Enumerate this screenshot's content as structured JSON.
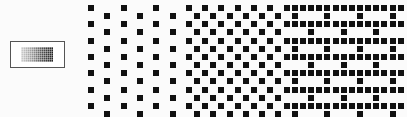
{
  "thumbnail": {
    "label": "halftone-preview"
  },
  "pattern": {
    "origin_x": 88,
    "origin_y": 5,
    "cell": 8.15,
    "dot_size": 6,
    "dot_color": "#111111",
    "sections": [
      {
        "name": "sparse",
        "cols": [
          0,
          11
        ],
        "density": 0.25
      },
      {
        "name": "checker",
        "cols": [
          12,
          23
        ],
        "density": 0.5
      },
      {
        "name": "dense",
        "cols": [
          24,
          38
        ],
        "density": 0.75
      }
    ],
    "rows": 14,
    "cols": 39
  }
}
